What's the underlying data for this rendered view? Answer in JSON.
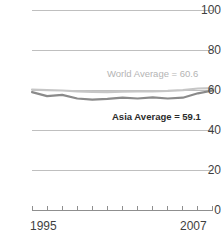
{
  "chart_data": {
    "type": "line",
    "title": "",
    "subtitle": "",
    "xlabel": "",
    "ylabel": "",
    "xlim": [
      1995,
      2007
    ],
    "ylim": [
      0,
      100
    ],
    "grid": true,
    "legend_position": "inline-annotations",
    "y_ticks": [
      100,
      80,
      60,
      40,
      20,
      0
    ],
    "y_tick_labels": [
      "100",
      "80",
      "60",
      "40",
      "20",
      "0"
    ],
    "x_ticks": [
      1995,
      1996,
      1997,
      1998,
      1999,
      2000,
      2001,
      2002,
      2003,
      2004,
      2005,
      2006,
      2007
    ],
    "x_tick_labels_shown": [
      "1995",
      "2007"
    ],
    "x": [
      1995,
      1996,
      1997,
      1998,
      1999,
      2000,
      2001,
      2002,
      2003,
      2004,
      2005,
      2006,
      2007
    ],
    "series": [
      {
        "name": "World Average",
        "color": "#c6c6c6",
        "annotation": "World Average = 60.6",
        "annotation_value": 60.6,
        "values": [
          60.4,
          60.2,
          60.0,
          59.6,
          59.3,
          59.2,
          59.4,
          59.5,
          59.6,
          59.8,
          60.2,
          61.0,
          61.2
        ]
      },
      {
        "name": "Asia Average",
        "color": "#8a8a8a",
        "annotation": "Asia Average = 59.1",
        "annotation_value": 59.1,
        "values": [
          59.2,
          57.2,
          57.8,
          56.0,
          55.4,
          55.8,
          56.4,
          56.0,
          56.6,
          56.0,
          56.4,
          58.6,
          60.0
        ]
      }
    ]
  },
  "axes": {
    "y_labels": [
      "100",
      "80",
      "60",
      "40",
      "20",
      "0"
    ],
    "x_label_start": "1995",
    "x_label_end": "2007"
  },
  "annotations": {
    "world": "World Average = 60.6",
    "asia": "Asia Average = 59.1"
  },
  "colors": {
    "world_line": "#c6c6c6",
    "asia_line": "#8a8a8a",
    "gridline": "#bfbfbf",
    "axis_text": "#3f3f3f",
    "background": "#ffffff"
  }
}
